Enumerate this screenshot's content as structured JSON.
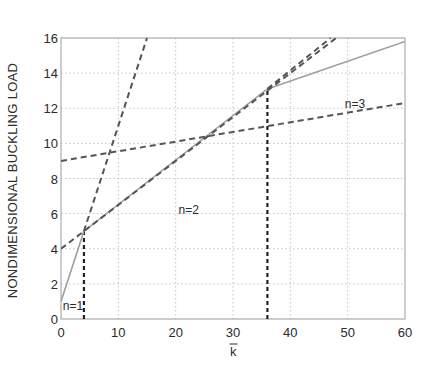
{
  "chart_data": {
    "type": "line",
    "title": "",
    "xlabel": "k̅",
    "xlabel_text": "k",
    "xlabel_has_overbar": true,
    "ylabel": "NONDIMENSIONAL BUCKLING LOAD",
    "xlim": [
      0,
      60
    ],
    "ylim": [
      0,
      16
    ],
    "xticks": [
      0,
      10,
      20,
      30,
      40,
      50,
      60
    ],
    "yticks": [
      0,
      2,
      4,
      6,
      8,
      10,
      12,
      14,
      16
    ],
    "grid": true,
    "legend": null,
    "series": [
      {
        "name": "buckling load envelope",
        "style": "solid",
        "color": "#a0a0a0",
        "x": [
          0,
          4,
          36,
          60
        ],
        "y": [
          1,
          5,
          13.1,
          15.8
        ]
      },
      {
        "name": "n=1 mode",
        "style": "dashed",
        "color": "#555555",
        "x": [
          4,
          15
        ],
        "y": [
          5,
          16
        ]
      },
      {
        "name": "n=2 mode",
        "style": "dashed",
        "color": "#555555",
        "x": [
          0,
          48
        ],
        "y": [
          4,
          16
        ]
      },
      {
        "name": "n=3 mode",
        "style": "dashed",
        "color": "#555555",
        "x": [
          0,
          60
        ],
        "y": [
          9,
          12.3
        ]
      },
      {
        "name": "n=3 mode (upper continuation)",
        "style": "dashed",
        "color": "#555555",
        "x": [
          36,
          47
        ],
        "y": [
          13.1,
          16
        ]
      }
    ],
    "vertical_markers": [
      {
        "x": 4,
        "y_top": 5,
        "style": "dashed",
        "color": "#222222"
      },
      {
        "x": 36,
        "y_top": 13.1,
        "style": "dashed",
        "color": "#222222"
      }
    ],
    "annotations": [
      {
        "text": "n=1",
        "x": 0.3,
        "y": 0.5
      },
      {
        "text": "n=2",
        "x": 20.5,
        "y": 6.0
      },
      {
        "text": "n=3",
        "x": 49.5,
        "y": 12.0
      }
    ]
  }
}
